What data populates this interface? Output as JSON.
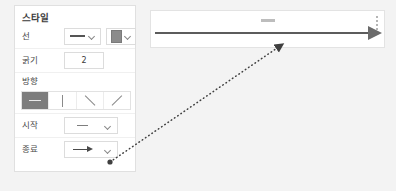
{
  "panel": {
    "title": "스타일",
    "rows": {
      "line": {
        "label": "선",
        "style_value": "solid-line",
        "color_value": "#8b8b8b"
      },
      "thickness": {
        "label": "굵기",
        "value": "2"
      },
      "direction": {
        "label": "방향",
        "options": [
          {
            "name": "horizontal",
            "selected": true
          },
          {
            "name": "vertical",
            "selected": false
          },
          {
            "name": "diagonal-down",
            "selected": false
          },
          {
            "name": "diagonal-up",
            "selected": false
          }
        ]
      },
      "start": {
        "label": "시작",
        "value": "none"
      },
      "end": {
        "label": "종료",
        "value": "arrow"
      }
    }
  },
  "canvas": {
    "shape": "horizontal-arrow",
    "line_color": "#5c5c5c",
    "arrowhead_color": "#6b6b6b",
    "handles": [
      "top-center-handle",
      "right-dots-handle"
    ]
  },
  "annotation": {
    "type": "dotted-arrow",
    "from": "end-dropdown-chevron",
    "to": "canvas-arrowhead",
    "color": "#4a4a4a"
  },
  "colors": {
    "page_background": "#f3f3f3",
    "panel_background": "#ffffff",
    "border": "#e0e0e0",
    "selected_button": "#7d7d7d"
  }
}
